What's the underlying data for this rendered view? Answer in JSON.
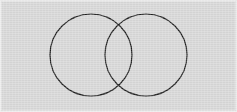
{
  "figure": {
    "canvas": {
      "width": 237,
      "height": 112,
      "background_color": "#d7d7d7",
      "frame_color": "#ececec",
      "frame_inner_color": "#e2e2e2"
    },
    "stroke": {
      "color": "#1e1e1e",
      "width": 1.2,
      "fill": "none"
    }
  },
  "chart_data": {
    "type": "diagram",
    "subtype": "venn",
    "xlabel": "",
    "ylabel": "",
    "grid": false,
    "legend": "none",
    "xlim": [
      0,
      237
    ],
    "ylim": [
      0,
      112
    ],
    "sets": 2,
    "shapes": [
      {
        "name": "left-circle",
        "type": "circle",
        "cx": 91,
        "cy": 55,
        "r": 41,
        "stroke": "#1e1e1e",
        "stroke_width": 1.2,
        "fill": "none"
      },
      {
        "name": "right-circle",
        "type": "circle",
        "cx": 146,
        "cy": 55,
        "r": 41,
        "stroke": "#1e1e1e",
        "stroke_width": 1.2,
        "fill": "none"
      }
    ],
    "center_distance": 55,
    "radius": 41,
    "intersection_points": [
      {
        "name": "upper-intersection",
        "x": 118.5,
        "y": 24.6
      },
      {
        "name": "lower-intersection",
        "x": 118.5,
        "y": 85.4
      }
    ],
    "labels": [],
    "annotations": []
  }
}
